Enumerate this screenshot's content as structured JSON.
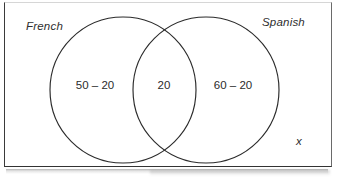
{
  "diagram": {
    "type": "venn",
    "universal_set_label": "x",
    "sets": [
      {
        "id": "french",
        "label": "French",
        "region_label": "50 – 20",
        "cx": 123,
        "cy": 90,
        "r": 73
      },
      {
        "id": "spanish",
        "label": "Spanish",
        "region_label": "60 – 20",
        "cx": 206,
        "cy": 90,
        "r": 73
      }
    ],
    "intersection": {
      "id": "french-and-spanish",
      "region_label": "20"
    },
    "colors": {
      "stroke": "#2b2b2b",
      "frame": "#333333",
      "background": "#ffffff",
      "text": "#2b2b2b"
    }
  }
}
